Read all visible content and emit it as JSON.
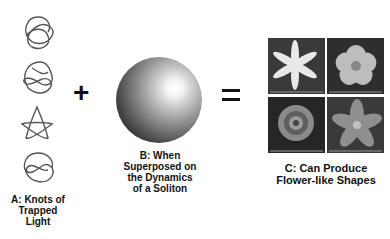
{
  "panels": {
    "a": {
      "label_lines": [
        "A: Knots of",
        "Trapped",
        "Light"
      ],
      "knot_count": 4,
      "knots": [
        "trefoil-knot",
        "figure-eight-knot",
        "pentagram-knot",
        "twisted-knot"
      ]
    },
    "b": {
      "label_lines": [
        "B: When",
        "Superposed on",
        "the Dynamics",
        "of a Soliton"
      ],
      "image": "soliton-sphere"
    },
    "c": {
      "label_lines": [
        "C: Can Produce",
        "Flower-like Shapes"
      ],
      "flowers": [
        "six-petal-star-flower",
        "five-petal-round-flower",
        "clustered-rosette-flower",
        "lily-flower"
      ]
    }
  },
  "operators": {
    "plus": "+",
    "equals": "="
  },
  "colors": {
    "text": "#111111",
    "knot_stroke": "#555555",
    "background": "#ffffff"
  }
}
